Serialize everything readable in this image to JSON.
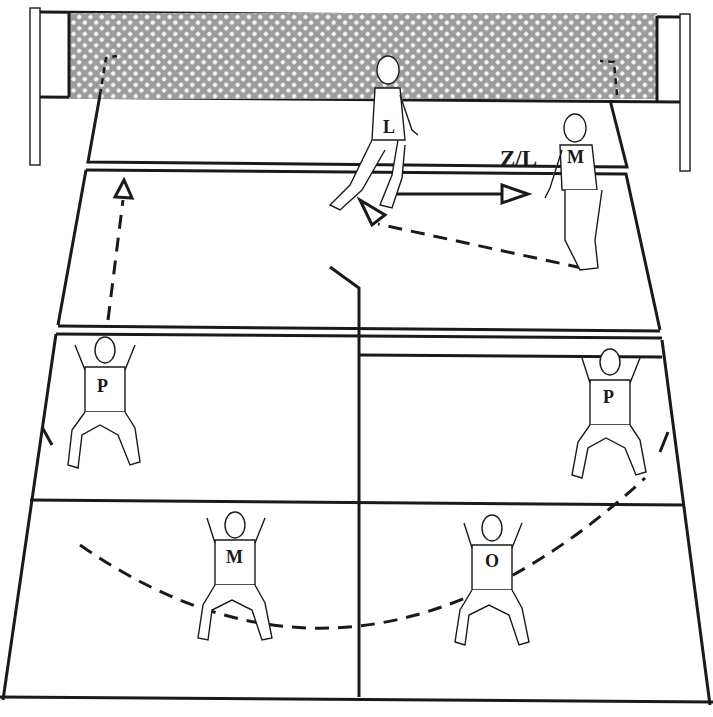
{
  "diagram": {
    "net": {
      "pattern": "mesh",
      "color": "#a8a8a8"
    },
    "zone_label": "Z/L",
    "players": [
      {
        "id": "front-libero",
        "label": "L",
        "facing": "side",
        "x": 385,
        "y": 130
      },
      {
        "id": "front-middle",
        "label": "M",
        "facing": "back",
        "x": 575,
        "y": 185
      },
      {
        "id": "back-left-passer",
        "label": "P",
        "facing": "back",
        "x": 105,
        "y": 395
      },
      {
        "id": "back-right-passer",
        "label": "P",
        "facing": "back",
        "x": 610,
        "y": 405
      },
      {
        "id": "back-center-middle",
        "label": "M",
        "facing": "back",
        "x": 235,
        "y": 560
      },
      {
        "id": "back-center-opposite",
        "label": "O",
        "facing": "back",
        "x": 492,
        "y": 565
      }
    ],
    "arrows": [
      {
        "type": "solid",
        "from": "L",
        "to": "M",
        "description": "libero moves toward middle"
      },
      {
        "type": "dashed",
        "from": "M",
        "to": "L",
        "description": "middle returns"
      },
      {
        "type": "dashed",
        "from": "left back court",
        "to": "net",
        "description": "upward movement"
      }
    ],
    "reception_arc": "dashed semicircle linking P, M, O, P"
  }
}
